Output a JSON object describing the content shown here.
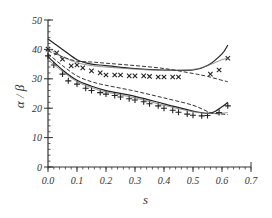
{
  "chart_data": {
    "type": "line",
    "title": "",
    "xlabel": "s",
    "ylabel": "α / β",
    "xlim": [
      0.0,
      0.7
    ],
    "ylim": [
      0,
      50
    ],
    "x_ticks": [
      "0.0",
      "0.1",
      "0.2",
      "0.3",
      "0.4",
      "0.5",
      "0.6",
      "0.7"
    ],
    "y_ticks": [
      "0",
      "10",
      "20",
      "30",
      "40",
      "50"
    ],
    "grid": false,
    "legend": null,
    "series": [
      {
        "name": "upper data (×)",
        "style": "marker-x",
        "x": [
          0.0,
          0.03,
          0.05,
          0.08,
          0.1,
          0.12,
          0.15,
          0.18,
          0.2,
          0.23,
          0.25,
          0.28,
          0.3,
          0.33,
          0.35,
          0.38,
          0.4,
          0.43,
          0.45,
          0.56,
          0.59,
          0.62
        ],
        "y": [
          40.1,
          38.8,
          36.7,
          34.4,
          34.7,
          33.7,
          32.7,
          32.0,
          31.3,
          31.3,
          31.3,
          31.0,
          31.0,
          31.0,
          30.8,
          30.6,
          30.6,
          30.6,
          30.6,
          31.6,
          33.0,
          37.0
        ]
      },
      {
        "name": "upper model solid",
        "style": "solid",
        "x": [
          0.0,
          0.05,
          0.1,
          0.15,
          0.2,
          0.3,
          0.4,
          0.5,
          0.55,
          0.6,
          0.62
        ],
        "y": [
          43.5,
          40.0,
          36.5,
          35.0,
          34.5,
          33.5,
          33.0,
          33.0,
          34.5,
          38.5,
          41.5
        ]
      },
      {
        "name": "upper model thin",
        "style": "thin",
        "x": [
          0.0,
          0.05,
          0.1,
          0.15,
          0.2,
          0.3,
          0.4,
          0.5,
          0.55,
          0.6,
          0.62
        ],
        "y": [
          40.5,
          37.5,
          35.5,
          34.5,
          34.0,
          33.3,
          32.8,
          33.2,
          34.5,
          36.5,
          37.0
        ]
      },
      {
        "name": "upper model dashed",
        "style": "dashed",
        "x": [
          0.0,
          0.05,
          0.1,
          0.15,
          0.2,
          0.3,
          0.4,
          0.5,
          0.55,
          0.6,
          0.62
        ],
        "y": [
          39.5,
          37.5,
          36.0,
          35.7,
          35.3,
          34.5,
          33.5,
          31.8,
          30.8,
          29.5,
          29.0
        ]
      },
      {
        "name": "lower data (+)",
        "style": "marker-plus",
        "x": [
          0.0,
          0.02,
          0.05,
          0.07,
          0.1,
          0.13,
          0.15,
          0.18,
          0.2,
          0.23,
          0.25,
          0.28,
          0.3,
          0.33,
          0.35,
          0.38,
          0.4,
          0.43,
          0.45,
          0.48,
          0.5,
          0.53,
          0.55,
          0.59,
          0.62
        ],
        "y": [
          37.8,
          34.7,
          31.6,
          29.3,
          28.2,
          26.8,
          26.0,
          25.3,
          24.8,
          24.3,
          23.8,
          23.2,
          22.8,
          22.2,
          21.5,
          20.8,
          20.0,
          19.3,
          18.6,
          18.0,
          17.6,
          17.4,
          17.5,
          18.5,
          20.8
        ]
      },
      {
        "name": "lower model solid",
        "style": "solid",
        "x": [
          0.0,
          0.05,
          0.1,
          0.15,
          0.2,
          0.3,
          0.4,
          0.5,
          0.56,
          0.6,
          0.62
        ],
        "y": [
          37.5,
          33.0,
          29.5,
          27.5,
          26.0,
          24.0,
          21.5,
          19.0,
          18.3,
          20.5,
          22.0
        ]
      },
      {
        "name": "lower model thin",
        "style": "thin",
        "x": [
          0.0,
          0.05,
          0.1,
          0.15,
          0.2,
          0.3,
          0.4,
          0.5,
          0.56,
          0.6,
          0.62
        ],
        "y": [
          36.5,
          32.5,
          29.0,
          27.0,
          25.5,
          23.5,
          21.0,
          18.8,
          18.2,
          18.3,
          18.5
        ]
      },
      {
        "name": "lower model dashed",
        "style": "dashed",
        "x": [
          0.0,
          0.05,
          0.1,
          0.15,
          0.2,
          0.3,
          0.4,
          0.5,
          0.56,
          0.6,
          0.62
        ],
        "y": [
          38.5,
          34.5,
          31.0,
          29.0,
          27.8,
          25.8,
          23.5,
          21.0,
          18.5,
          18.0,
          17.8
        ]
      }
    ]
  }
}
